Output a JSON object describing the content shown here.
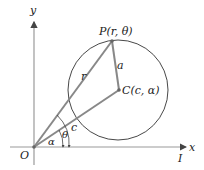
{
  "diagram": {
    "axes": {
      "x_label": "x",
      "y_label": "y",
      "origin_label": "O",
      "polar_axis_label": "I"
    },
    "points": {
      "P": {
        "label": "P(r, θ)"
      },
      "C": {
        "label": "C(c, α)"
      }
    },
    "segments": {
      "OP": {
        "label": "r"
      },
      "PC": {
        "label": "a"
      },
      "OC": {
        "label": "c"
      }
    },
    "angles": {
      "theta": {
        "label": "θ"
      },
      "alpha": {
        "label": "α"
      }
    },
    "colors": {
      "line": "#888888",
      "axis": "#9a9a9a",
      "circle": "#333333",
      "text": "#222222"
    }
  }
}
